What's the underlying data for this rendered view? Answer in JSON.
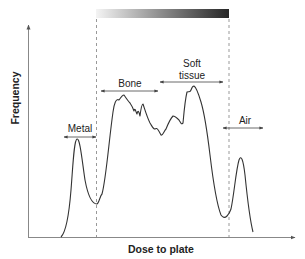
{
  "diagram": {
    "axes": {
      "x_label": "Dose to plate",
      "y_label": "Frequency"
    },
    "gradient_bar": {
      "from_color": "#f2f2f2",
      "to_color": "#2a2a2a"
    },
    "regions": [
      {
        "label": "Metal"
      },
      {
        "label": "Bone"
      },
      {
        "label_line1": "Soft",
        "label_line2": "tissue"
      },
      {
        "label": "Air"
      }
    ],
    "colors": {
      "curve": "#333333",
      "axis": "#888888",
      "dashed": "#999999",
      "text": "#222222"
    }
  }
}
